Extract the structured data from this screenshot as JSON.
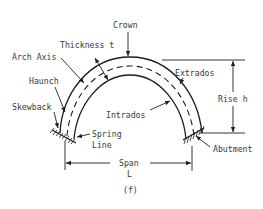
{
  "figure": {
    "type": "arch-terminology-diagram",
    "caption": "(f)",
    "labels": {
      "crown": "Crown",
      "thickness": "Thickness t",
      "arch_axis": "Arch Axis",
      "haunch": "Haunch",
      "skewback": "Skewback",
      "spring_line_1": "Spring",
      "spring_line_2": "Line",
      "intrados": "Intrados",
      "extrados": "Extrados",
      "rise": "Rise h",
      "abutment": "Abutment",
      "span_1": "Span",
      "span_2": "L"
    },
    "colors": {
      "line": "#1e1e1e",
      "text": "#3a3a3a",
      "background": "#ffffff"
    }
  }
}
